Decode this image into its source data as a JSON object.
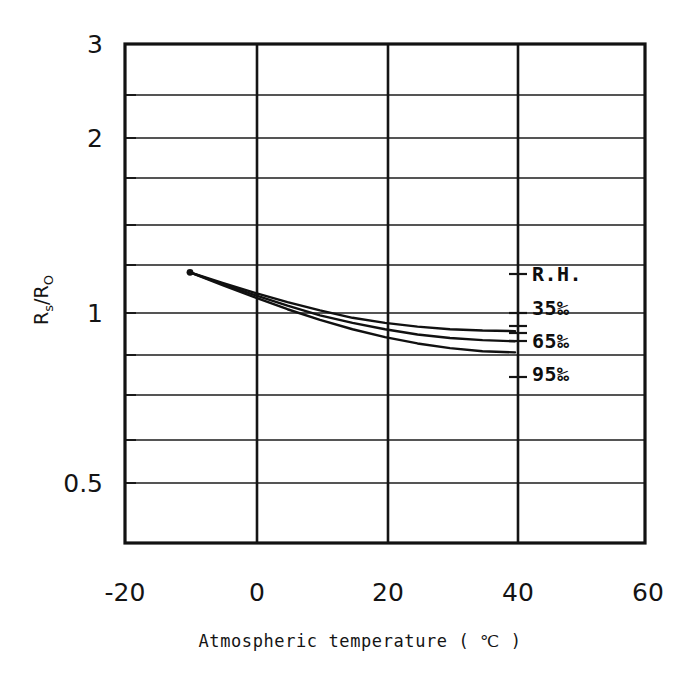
{
  "figure": {
    "background": "#ffffff",
    "ink_color": "#151515"
  },
  "chart_data": {
    "type": "line",
    "title": "",
    "xlabel": "Atmospheric temperature ( ℃ )",
    "ylabel": "Rs/Ro",
    "ylabel_parts": {
      "main1": "R",
      "sub1": "s",
      "slash": "/",
      "main2": "R",
      "sub2": "O"
    },
    "xlim": [
      -20,
      60
    ],
    "ylim": [
      0.42,
      3.0
    ],
    "yscale": "log",
    "xscale": "linear",
    "grid": true,
    "legend_position": "inside-right",
    "xticks": [
      -20,
      0,
      20,
      40,
      60
    ],
    "xtick_labels": [
      "-20",
      "0",
      "20",
      "40",
      "60"
    ],
    "yticks_labeled": [
      3,
      2,
      1,
      0.5
    ],
    "ytick_labels": [
      "3",
      "2",
      "1",
      "0.5"
    ],
    "yticks_minor": [
      2.5,
      1.9,
      1.8,
      1.7,
      1.6,
      1.5,
      1.4,
      1.3,
      1.2,
      1.1,
      0.95,
      0.9,
      0.85,
      0.8,
      0.75,
      0.7,
      0.65,
      0.6,
      0.55,
      0.45
    ],
    "ygridlines": [
      2.5,
      2.0,
      1.75,
      1.5,
      1.3,
      1.15,
      1.0,
      0.9,
      0.8,
      0.72,
      0.65,
      0.58,
      0.5,
      0.45
    ],
    "xgridlines": [
      -20,
      0,
      20,
      40,
      60
    ],
    "series": [
      {
        "name": "35%",
        "label": "35‰",
        "x": [
          -10,
          -5,
          0,
          5,
          10,
          15,
          20,
          25,
          30,
          35,
          40
        ],
        "y": [
          1.22,
          1.17,
          1.125,
          1.085,
          1.05,
          1.02,
          1.0,
          0.985,
          0.975,
          0.97,
          0.968
        ]
      },
      {
        "name": "65%",
        "label": "65‰",
        "x": [
          -10,
          -5,
          0,
          5,
          10,
          15,
          20,
          25,
          30,
          35,
          40
        ],
        "y": [
          1.22,
          1.165,
          1.115,
          1.07,
          1.03,
          1.0,
          0.975,
          0.955,
          0.942,
          0.934,
          0.93
        ]
      },
      {
        "name": "95%",
        "label": "95‰",
        "x": [
          -10,
          -5,
          0,
          5,
          10,
          15,
          20,
          25,
          30,
          35,
          40
        ],
        "y": [
          1.22,
          1.16,
          1.105,
          1.055,
          1.012,
          0.975,
          0.945,
          0.922,
          0.905,
          0.894,
          0.89
        ]
      }
    ],
    "legend_header": "R.H.",
    "legend_entries": [
      "R.H.",
      "35‰",
      "65‰",
      "95‰"
    ],
    "start_marker": {
      "x": -10,
      "y": 1.22,
      "visible": true
    }
  },
  "legend": {
    "header": "R.H.",
    "items": [
      {
        "label": "35‰"
      },
      {
        "label": "65‰"
      },
      {
        "label": "95‰"
      }
    ]
  },
  "axes": {
    "x_title": "Atmospheric temperature ( ℃ )",
    "y_title": "Rs/Ro"
  }
}
